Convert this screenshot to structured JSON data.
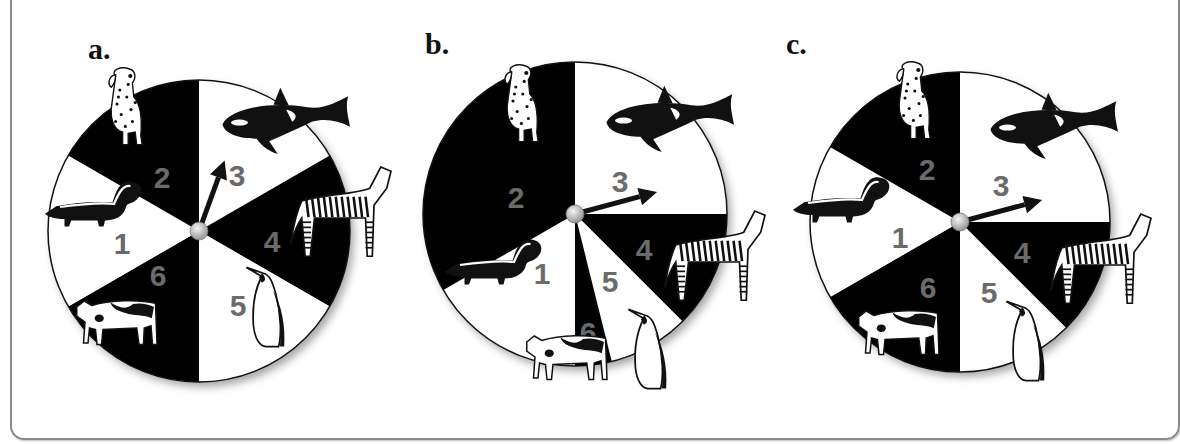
{
  "figure": {
    "cutoff_text": "",
    "colors": {
      "black_sector": "#000000",
      "white_sector": "#ffffff",
      "number": "#6b6b6b",
      "hub": "#c8c8c8",
      "frame": "#8a8a8a"
    },
    "panels": [
      {
        "label": "a.",
        "pointer_deg": 20,
        "sectors": [
          {
            "number": "3",
            "animal": "orca",
            "start": 0,
            "end": 60,
            "fill": "white"
          },
          {
            "number": "4",
            "animal": "zebra",
            "start": 60,
            "end": 120,
            "fill": "black"
          },
          {
            "number": "5",
            "animal": "penguin",
            "start": 120,
            "end": 180,
            "fill": "white"
          },
          {
            "number": "6",
            "animal": "cow",
            "start": 180,
            "end": 240,
            "fill": "black"
          },
          {
            "number": "1",
            "animal": "skunk",
            "start": 240,
            "end": 300,
            "fill": "white"
          },
          {
            "number": "2",
            "animal": "dalmatian",
            "start": 300,
            "end": 360,
            "fill": "black"
          }
        ]
      },
      {
        "label": "b.",
        "pointer_deg": 75,
        "sectors": [
          {
            "number": "3",
            "animal": "orca",
            "start": 0,
            "end": 90,
            "fill": "white"
          },
          {
            "number": "4",
            "animal": "zebra",
            "start": 90,
            "end": 135,
            "fill": "black"
          },
          {
            "number": "5",
            "animal": "penguin",
            "start": 135,
            "end": 166,
            "fill": "white"
          },
          {
            "number": "6",
            "animal": "cow",
            "start": 166,
            "end": 180,
            "fill": "black"
          },
          {
            "number": "1",
            "animal": "skunk",
            "start": 180,
            "end": 240,
            "fill": "white"
          },
          {
            "number": "2",
            "animal": "dalmatian",
            "start": 240,
            "end": 360,
            "fill": "black"
          }
        ]
      },
      {
        "label": "c.",
        "pointer_deg": 75,
        "sectors": [
          {
            "number": "3",
            "animal": "orca",
            "start": 0,
            "end": 90,
            "fill": "white"
          },
          {
            "number": "4",
            "animal": "zebra",
            "start": 90,
            "end": 135,
            "fill": "black"
          },
          {
            "number": "5",
            "animal": "penguin",
            "start": 135,
            "end": 180,
            "fill": "white"
          },
          {
            "number": "6",
            "animal": "cow",
            "start": 180,
            "end": 240,
            "fill": "black"
          },
          {
            "number": "1",
            "animal": "skunk",
            "start": 240,
            "end": 300,
            "fill": "white"
          },
          {
            "number": "2",
            "animal": "dalmatian",
            "start": 300,
            "end": 360,
            "fill": "black"
          }
        ]
      }
    ]
  }
}
